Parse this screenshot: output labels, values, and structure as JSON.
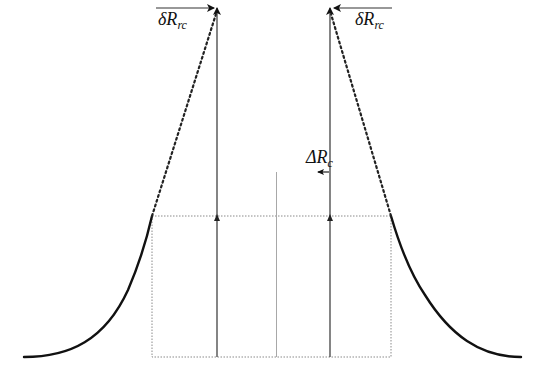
{
  "diagram": {
    "title": "",
    "colors": {
      "curve": "#111111",
      "arrow": "#222222",
      "dotted_box": "#8a8a8a",
      "center_line": "#a0a0a0",
      "dotted_slope": "#333333"
    },
    "labels": {
      "left_top": {
        "main": "δR",
        "sub": "rc"
      },
      "right_top": {
        "main": "δR",
        "sub": "rc"
      },
      "middle": {
        "main": "ΔR",
        "sub": "c"
      }
    },
    "elements": {
      "left_curve": "solid bell-flank curve rising from baseline to box top-left corner",
      "right_curve": "solid bell-flank curve descending from box top-right corner to baseline",
      "left_dotted_slope": "dotted line from box top-left corner up to left vertical arrow tip",
      "right_dotted_slope": "dotted line from box top-right corner up to right vertical arrow tip",
      "dotted_box": "dotted rectangle spanning between curve junctions down to baseline",
      "center_line": "thin vertical center reference line",
      "left_vertical_arrow": "upward arrow at left",
      "right_vertical_arrow": "upward arrow at right",
      "left_top_arrow": "rightward arrow pointing to left vertical tip",
      "right_top_arrow": "leftward arrow pointing to right vertical tip",
      "middle_small_arrow": "short leftward arrow beside right vertical line"
    }
  }
}
